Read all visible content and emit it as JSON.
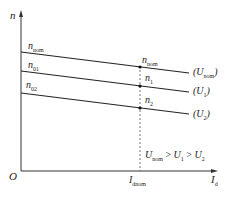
{
  "diagram": {
    "type": "speed-characteristic",
    "axes": {
      "y_label": "n",
      "x_label_main": "I",
      "x_label_sub": "d",
      "origin": "O"
    },
    "left_labels": [
      {
        "main": "n",
        "sub": "nom"
      },
      {
        "main": "n",
        "sub": "01"
      },
      {
        "main": "n",
        "sub": "02"
      }
    ],
    "points": [
      {
        "main": "n",
        "sub": "nom"
      },
      {
        "main": "n",
        "sub": "1"
      },
      {
        "main": "n",
        "sub": "2"
      }
    ],
    "curves": [
      {
        "open": "(U",
        "sub": "nom",
        "close": ")"
      },
      {
        "open": "(U",
        "sub": "1",
        "close": ")"
      },
      {
        "open": "(U",
        "sub": "2",
        "close": ")"
      }
    ],
    "x_mark": {
      "main": "I",
      "sub": "dnom"
    },
    "relation": {
      "u1": "U",
      "u1_sub": "nom",
      "gt1": " > ",
      "u2": "U",
      "u2_sub": "1",
      "gt2": " > ",
      "u3": "U",
      "u3_sub": "2"
    },
    "colors": {
      "line": "#222222",
      "dashed": "#555555"
    }
  }
}
